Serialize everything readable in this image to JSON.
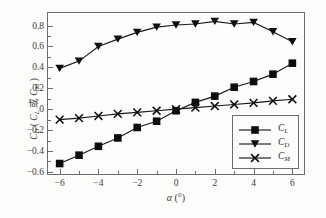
{
  "chart_data": {
    "type": "line",
    "title": "",
    "xlabel": "α (°)",
    "ylabel": "C_D ( C_L 或 C_M )",
    "xlim": [
      -6.6,
      6.6
    ],
    "ylim": [
      -0.62,
      0.92
    ],
    "grid": false,
    "legend_position": "lower-right-inside",
    "xticks": [
      -6,
      -4,
      -2,
      0,
      2,
      4,
      6
    ],
    "xtick_labels": [
      "−6",
      "−4",
      "−2",
      "0",
      "2",
      "4",
      "6"
    ],
    "xticks_minor": [
      -5,
      -3,
      -1,
      1,
      3,
      5
    ],
    "yticks": [
      -0.6,
      -0.4,
      -0.2,
      0,
      0.2,
      0.4,
      0.6,
      0.8
    ],
    "ytick_labels": [
      "−0.6",
      "−0.4",
      "−0.2",
      "0",
      "0.2",
      "0.4",
      "0.6",
      "0.8"
    ],
    "yticks_minor": [
      -0.5,
      -0.3,
      -0.1,
      0.1,
      0.3,
      0.5,
      0.7
    ],
    "x": [
      -6,
      -5,
      -4,
      -3,
      -2,
      -1,
      0,
      1,
      2,
      3,
      4,
      5,
      6
    ],
    "series": [
      {
        "name": "C_L",
        "marker": "filled-square",
        "values": [
          -0.52,
          -0.44,
          -0.355,
          -0.275,
          -0.175,
          -0.115,
          -0.015,
          0.065,
          0.125,
          0.21,
          0.265,
          0.335,
          0.44
        ]
      },
      {
        "name": "C_D",
        "marker": "filled-down-triangle",
        "values": [
          0.39,
          0.46,
          0.6,
          0.67,
          0.735,
          0.785,
          0.805,
          0.815,
          0.84,
          0.815,
          0.83,
          0.74,
          0.645
        ]
      },
      {
        "name": "C_M",
        "marker": "x-cross",
        "values": [
          -0.1,
          -0.085,
          -0.065,
          -0.045,
          -0.03,
          -0.015,
          0.0,
          0.015,
          0.03,
          0.045,
          0.06,
          0.08,
          0.095
        ]
      }
    ]
  },
  "axis_titles": {
    "x": {
      "symbol": "α",
      "unit": "(°)"
    },
    "y": {
      "main_symbol": "C",
      "main_sub": "D",
      "open_paren": "(",
      "alt1_symbol": "C",
      "alt1_sub": "L",
      "conjunction": "或",
      "alt2_symbol": "C",
      "alt2_sub": "M",
      "close_paren": ")"
    }
  },
  "legend": {
    "entries": [
      {
        "symbol": "C",
        "sub": "L",
        "marker": "filled-square"
      },
      {
        "symbol": "C",
        "sub": "D",
        "marker": "filled-down-triangle"
      },
      {
        "symbol": "C",
        "sub": "M",
        "marker": "x-cross"
      }
    ]
  },
  "colors": {
    "line": "#1a1a1a",
    "marker": "#0d0d0d",
    "frame": "#6e6e6e",
    "text": "#3b3b3b",
    "background": "#fdfdfc"
  }
}
